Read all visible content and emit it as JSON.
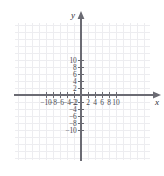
{
  "figure": {
    "kind": "cartesian-coordinate-plane",
    "width": 164,
    "height": 176,
    "background_color": "#ffffff"
  },
  "axes": {
    "x_letter": "x",
    "y_letter": "y",
    "axis_color": "#6b6b73",
    "grid_color": "#ededf0",
    "label_color": "#4a4a52",
    "origin_px": {
      "x": 81,
      "y": 95
    },
    "pixels_per_unit": 3.5,
    "x_range": [
      -12,
      12
    ],
    "y_range": [
      -12,
      12
    ],
    "tick_step": 2,
    "grid_step": 2,
    "grid_visible": true,
    "arrowheads": [
      "x-positive",
      "y-positive"
    ]
  },
  "chart_data": {
    "type": "scatter",
    "title": "",
    "xlabel": "x",
    "ylabel": "y",
    "xlim": [
      -12,
      12
    ],
    "ylim": [
      -12,
      12
    ],
    "grid": true,
    "legend": null,
    "series": [],
    "x_tick_labels": [
      "−10",
      "−8",
      "−6",
      "−4",
      "−2",
      "2",
      "4",
      "6",
      "8",
      "10"
    ],
    "x_tick_values": [
      -10,
      -8,
      -6,
      -4,
      -2,
      2,
      4,
      6,
      8,
      10
    ],
    "y_tick_labels": [
      "10",
      "8",
      "6",
      "4",
      "2",
      "−2",
      "−4",
      "−6",
      "−8",
      "−10"
    ],
    "y_tick_values": [
      10,
      8,
      6,
      4,
      2,
      -2,
      -4,
      -6,
      -8,
      -10
    ]
  }
}
